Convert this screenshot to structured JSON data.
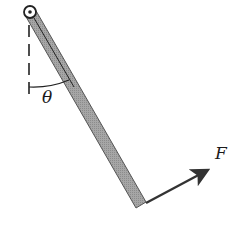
{
  "diagram": {
    "type": "physics-pendulum-rod",
    "labels": {
      "angle": "θ",
      "force": "F"
    },
    "elements": {
      "pivot": {
        "cx": 30,
        "cy": 12,
        "r": 6
      },
      "rod": {
        "from": [
          30,
          12
        ],
        "to": [
          141,
          205
        ],
        "width": 10,
        "fill": "#9a9a9a",
        "stroke": "#555555"
      },
      "vertical_reference": {
        "x": 29,
        "y1": 25,
        "y2": 96,
        "style": "dashed"
      },
      "force_arrow": {
        "from": [
          146,
          203
        ],
        "to": [
          213,
          167
        ],
        "color": "#333333"
      }
    }
  }
}
